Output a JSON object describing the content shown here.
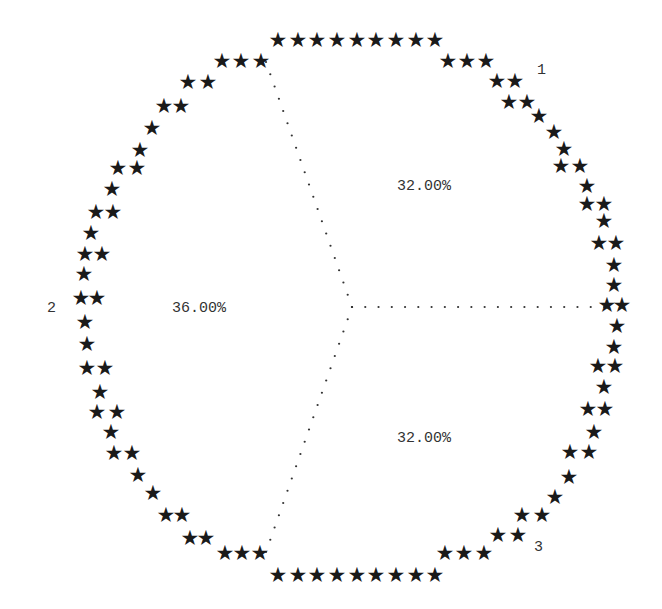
{
  "chart_data": {
    "type": "pie",
    "title": "",
    "style": "ascii-line-printer pie (asterisk outline, dotted slice dividers)",
    "categories": [
      "1",
      "2",
      "3"
    ],
    "values": [
      32.0,
      36.0,
      32.0
    ],
    "value_labels": [
      "32.00%",
      "36.00%",
      "32.00%"
    ],
    "units": "percent",
    "slices": [
      {
        "label": "1",
        "percent_label": "32.00%",
        "value": 32.0,
        "position": "upper-right"
      },
      {
        "label": "2",
        "percent_label": "36.00%",
        "value": 36.0,
        "position": "left"
      },
      {
        "label": "3",
        "percent_label": "32.00%",
        "value": 32.0,
        "position": "lower-right"
      }
    ]
  },
  "render": {
    "center": [
      352,
      307
    ],
    "divider_ends": [
      [
        266,
        62
      ],
      [
        604,
        307
      ],
      [
        266,
        552
      ]
    ],
    "slice_label_positions": [
      {
        "text_path": "chart_data.slices.0.label",
        "x": 537,
        "y": 74
      },
      {
        "text_path": "chart_data.slices.1.label",
        "x": 47,
        "y": 312
      },
      {
        "text_path": "chart_data.slices.2.label",
        "x": 534,
        "y": 551
      }
    ],
    "percent_label_positions": [
      {
        "x": 397,
        "y": 190
      },
      {
        "x": 172,
        "y": 312
      },
      {
        "x": 397,
        "y": 442
      }
    ],
    "stars": [
      [
        278,
        40
      ],
      [
        298,
        40
      ],
      [
        317,
        40
      ],
      [
        337,
        40
      ],
      [
        357,
        40
      ],
      [
        376,
        40
      ],
      [
        396,
        40
      ],
      [
        416,
        40
      ],
      [
        435,
        40
      ],
      [
        222,
        61
      ],
      [
        241,
        61
      ],
      [
        261,
        61
      ],
      [
        188,
        82
      ],
      [
        208,
        82
      ],
      [
        164,
        106
      ],
      [
        181,
        106
      ],
      [
        152,
        128
      ],
      [
        140,
        150
      ],
      [
        118,
        168
      ],
      [
        137,
        168
      ],
      [
        112,
        189
      ],
      [
        96,
        212
      ],
      [
        113,
        212
      ],
      [
        91,
        233
      ],
      [
        85,
        254
      ],
      [
        102,
        254
      ],
      [
        84,
        274
      ],
      [
        81,
        298
      ],
      [
        97,
        298
      ],
      [
        85,
        322
      ],
      [
        87,
        344
      ],
      [
        87,
        368
      ],
      [
        105,
        368
      ],
      [
        100,
        392
      ],
      [
        97,
        412
      ],
      [
        117,
        412
      ],
      [
        111,
        432
      ],
      [
        114,
        453
      ],
      [
        132,
        453
      ],
      [
        138,
        475
      ],
      [
        153,
        493
      ],
      [
        166,
        515
      ],
      [
        182,
        515
      ],
      [
        190,
        538
      ],
      [
        206,
        538
      ],
      [
        225,
        553
      ],
      [
        242,
        553
      ],
      [
        260,
        553
      ],
      [
        278,
        575
      ],
      [
        298,
        575
      ],
      [
        317,
        575
      ],
      [
        337,
        575
      ],
      [
        357,
        575
      ],
      [
        376,
        575
      ],
      [
        396,
        575
      ],
      [
        416,
        575
      ],
      [
        435,
        575
      ],
      [
        448,
        61
      ],
      [
        467,
        61
      ],
      [
        486,
        61
      ],
      [
        497,
        81
      ],
      [
        515,
        81
      ],
      [
        509,
        102
      ],
      [
        527,
        102
      ],
      [
        539,
        116
      ],
      [
        554,
        132
      ],
      [
        564,
        149
      ],
      [
        561,
        166
      ],
      [
        580,
        166
      ],
      [
        587,
        186
      ],
      [
        587,
        204
      ],
      [
        604,
        204
      ],
      [
        604,
        221
      ],
      [
        599,
        243
      ],
      [
        616,
        243
      ],
      [
        614,
        265
      ],
      [
        614,
        285
      ],
      [
        607,
        305
      ],
      [
        622,
        305
      ],
      [
        617,
        326
      ],
      [
        614,
        347
      ],
      [
        598,
        366
      ],
      [
        615,
        366
      ],
      [
        604,
        387
      ],
      [
        588,
        409
      ],
      [
        605,
        409
      ],
      [
        594,
        432
      ],
      [
        570,
        452
      ],
      [
        589,
        452
      ],
      [
        569,
        477
      ],
      [
        555,
        497
      ],
      [
        522,
        515
      ],
      [
        542,
        515
      ],
      [
        498,
        535
      ],
      [
        518,
        535
      ],
      [
        445,
        553
      ],
      [
        464,
        553
      ],
      [
        484,
        553
      ]
    ],
    "star_glyph": "★"
  }
}
